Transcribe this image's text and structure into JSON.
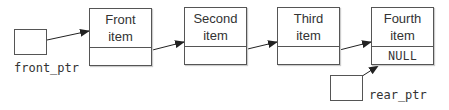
{
  "diagram": {
    "nodes": [
      {
        "line1": "Front",
        "line2": "item",
        "next": ""
      },
      {
        "line1": "Second",
        "line2": "item",
        "next": ""
      },
      {
        "line1": "Third",
        "line2": "item",
        "next": ""
      },
      {
        "line1": "Fourth",
        "line2": "item",
        "next": "NULL"
      }
    ],
    "pointers": {
      "front": {
        "label": "front_ptr",
        "target": "Front item"
      },
      "rear": {
        "label": "rear_ptr",
        "target": "Fourth item"
      }
    },
    "colors": {
      "stroke": "#555555",
      "text": "#333333",
      "arrow": "#222222"
    }
  }
}
